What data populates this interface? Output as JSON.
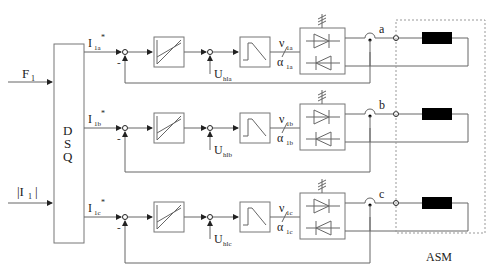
{
  "diagram": {
    "inputs": {
      "flux": {
        "label": "F",
        "sub": "1"
      },
      "current_mag": {
        "label": "|I",
        "sub": "1",
        "tail": "|"
      }
    },
    "dsq_block": {
      "lines": [
        "D",
        "S",
        "Q"
      ]
    },
    "phases": [
      {
        "id": "a",
        "ref": {
          "label": "I",
          "sub": "1a",
          "sup": "*"
        },
        "minus": "-",
        "disturbance": {
          "label": "U",
          "sub": "hla"
        },
        "nu": {
          "label": "ν",
          "sub": "1a"
        },
        "alpha": {
          "label": "α",
          "sub": "1a"
        },
        "terminal": "a"
      },
      {
        "id": "b",
        "ref": {
          "label": "I",
          "sub": "1b",
          "sup": "*"
        },
        "minus": "-",
        "disturbance": {
          "label": "U",
          "sub": "hlb"
        },
        "nu": {
          "label": "ν",
          "sub": "1b"
        },
        "alpha": {
          "label": "α",
          "sub": "1b"
        },
        "terminal": "b"
      },
      {
        "id": "c",
        "ref": {
          "label": "I",
          "sub": "1c",
          "sup": "*"
        },
        "minus": "-",
        "disturbance": {
          "label": "U",
          "sub": "hlc"
        },
        "nu": {
          "label": "ν",
          "sub": "1c"
        },
        "alpha": {
          "label": "α",
          "sub": "1c"
        },
        "terminal": "c"
      }
    ],
    "machine_label": "ASM",
    "colors": {
      "line": "#666666",
      "winding": "#000000",
      "dashed": "#999999"
    }
  }
}
